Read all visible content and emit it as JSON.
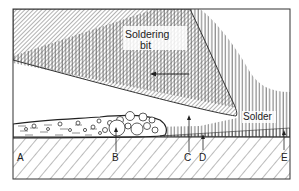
{
  "diagram": {
    "type": "cross-section schematic",
    "labels": {
      "soldering_bit": "Soldering",
      "soldering_bit_line2": "bit",
      "solder": "Solder",
      "a": "A",
      "b": "B",
      "c": "C",
      "d": "D",
      "e": "E"
    },
    "direction_arrow": "left",
    "regions": [
      {
        "name": "soldering-bit",
        "pattern": "diagonal hatch"
      },
      {
        "name": "solder",
        "pattern": "vertical hatch"
      },
      {
        "name": "flux-layer",
        "pattern": "dashes with bubbles"
      },
      {
        "name": "substrate",
        "pattern": "wide diagonal hatch"
      }
    ],
    "colors": {
      "ink": "#2a2a2a",
      "background": "#ffffff"
    }
  }
}
